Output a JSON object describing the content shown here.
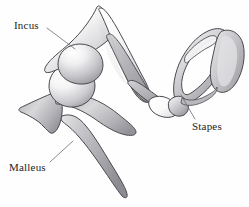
{
  "figure": {
    "background_color": "#fefefe",
    "outline_color": "#4a4a4f",
    "label_color": "#1d1d22",
    "leader_line_color": "#6e6e74",
    "width": 249,
    "height": 207
  },
  "labels": [
    {
      "id": "incus",
      "text": "Incus",
      "x": 14,
      "y": 20,
      "leader": {
        "x1": 47,
        "y1": 28,
        "x2": 75,
        "y2": 49
      }
    },
    {
      "id": "malleus",
      "text": "Malleus",
      "x": 9,
      "y": 162,
      "leader": {
        "x1": 50,
        "y1": 162,
        "x2": 73,
        "y2": 141
      }
    },
    {
      "id": "stapes",
      "text": "Stapes",
      "x": 192,
      "y": 121,
      "leader": {
        "x1": 195,
        "y1": 119,
        "x2": 181,
        "y2": 95
      }
    }
  ],
  "structures": [
    {
      "id": "incus",
      "name": "Incus",
      "description": "Anvil-shaped ossicle with short process, body and long process",
      "fill_light": "#fdfdfd",
      "fill_mid": "#d4d4d6",
      "fill_dark": "#9d9da1"
    },
    {
      "id": "malleus",
      "name": "Malleus",
      "description": "Hammer-shaped ossicle with head, lateral process and manubrium handle",
      "fill_light": "#fbfbfb",
      "fill_mid": "#c8c8cb",
      "fill_dark": "#96969b"
    },
    {
      "id": "stapes",
      "name": "Stapes",
      "description": "Stirrup-shaped ossicle with head, anterior and posterior crura, obturator foramen and footplate",
      "fill_light": "#f2f2f3",
      "fill_mid": "#c0c0c4",
      "fill_dark": "#94949a"
    },
    {
      "id": "incudostapedial-joint",
      "name": "Incudostapedial joint",
      "description": "Bright articulation between incus long process and stapes head",
      "fill_light": "#ffffff",
      "fill_mid": "#ededee",
      "fill_dark": "#cfcfd2"
    }
  ]
}
